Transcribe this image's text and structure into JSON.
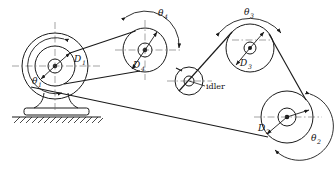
{
  "diagram": {
    "type": "mechanical-schematic",
    "canvas": {
      "width": 336,
      "height": 172
    },
    "stroke_color": "#1a1a1a",
    "centerline_color": "#555555",
    "background": "#ffffff",
    "labels": {
      "d1": "D",
      "d1_sub": "1",
      "d2": "D",
      "d2_sub": "2",
      "d3": "D",
      "d3_sub": "3",
      "d4": "D",
      "d4_sub": "4",
      "theta1": "θ",
      "theta1_sub": "1",
      "theta2": "θ",
      "theta2_sub": "2",
      "theta3": "θ",
      "theta3_sub": "3",
      "theta4": "θ",
      "theta4_sub": "4",
      "idler": "idler"
    },
    "pulleys": [
      {
        "name": "pulley-1",
        "cx": 55,
        "cy": 66,
        "outer_r": 33,
        "pitch_r": 20,
        "hub_r": 7,
        "label": "D1",
        "angle_label": "theta1"
      },
      {
        "name": "pulley-4",
        "cx": 145,
        "cy": 50,
        "pitch_r": 22,
        "hub_r": 7,
        "label": "D4",
        "angle_label": "theta4"
      },
      {
        "name": "pulley-idler",
        "cx": 189,
        "cy": 81,
        "pitch_r": 14,
        "hub_r": 5,
        "label": "idler"
      },
      {
        "name": "pulley-3",
        "cx": 250,
        "cy": 48,
        "pitch_r": 24,
        "hub_r": 6,
        "label": "D3",
        "angle_label": "theta3"
      },
      {
        "name": "pulley-2",
        "cx": 287,
        "cy": 117,
        "pitch_r": 26,
        "hub_r": 9,
        "label": "D2",
        "angle_label": "theta2"
      }
    ],
    "support": {
      "name": "pedestal-base",
      "ground_hatched": true
    }
  }
}
